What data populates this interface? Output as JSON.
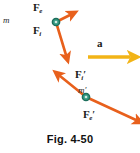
{
  "figure": {
    "caption": "Fig. 4-50",
    "background_color": "#ffffff",
    "vector_color": "#e8601c",
    "accel_color": "#f2b417",
    "mass_marker_fill": "#3a9d86",
    "mass_marker_ring": "#1d6e5c",
    "label_color": "#1a1a1a"
  },
  "upper_system": {
    "mass": {
      "label": "m",
      "prime": "",
      "x": 56,
      "y": 22
    },
    "forces": [
      {
        "name": "external-force-upper",
        "symbol": "F",
        "subscript": "e",
        "prime": "",
        "label_x": 33,
        "label_y": 3,
        "from_x": 56,
        "from_y": 22,
        "to_x": 70,
        "to_y": 15
      },
      {
        "name": "internal-force-upper",
        "symbol": "F",
        "subscript": "i",
        "prime": "",
        "label_x": 33,
        "label_y": 26,
        "from_x": 56,
        "from_y": 22,
        "to_x": 66,
        "to_y": 55
      }
    ]
  },
  "acceleration": {
    "label": "a",
    "label_x": 98,
    "label_y": 39,
    "arrow_from_x": 88,
    "arrow_from_y": 57,
    "arrow_to_x": 130,
    "arrow_to_y": 57
  },
  "lower_system": {
    "mass": {
      "label": "m",
      "prime": "′",
      "x": 86,
      "y": 97
    },
    "forces": [
      {
        "name": "internal-force-lower",
        "symbol": "F",
        "subscript": "i",
        "prime": "′",
        "label_x": 76,
        "label_y": 70,
        "from_x": 86,
        "from_y": 97,
        "to_x": 60,
        "to_y": 76
      },
      {
        "name": "external-force-lower",
        "symbol": "F",
        "subscript": "e",
        "prime": "′",
        "label_x": 84,
        "label_y": 110,
        "from_x": 86,
        "from_y": 97,
        "to_x": 136,
        "to_y": 120
      }
    ]
  }
}
